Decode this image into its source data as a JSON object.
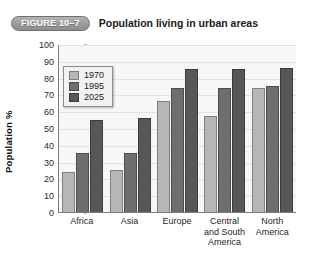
{
  "figure": {
    "badge_label": "FIGURE 10–7",
    "title": "Population living in urban areas"
  },
  "colors": {
    "series_1970": "#b6b6b6",
    "series_1995": "#6e6e6e",
    "series_2025": "#575757",
    "plot_background": "#f7f7f7",
    "gridline": "#e2e2e2",
    "axis": "#7d7d7d",
    "badge_background": "#9a9a9a",
    "badge_text": "#ffffff"
  },
  "chart_data": {
    "type": "bar",
    "title": "Population living in urban areas",
    "xlabel": "",
    "ylabel": "Population %",
    "ylim": [
      0,
      100
    ],
    "yticks": [
      0,
      10,
      20,
      30,
      40,
      50,
      60,
      70,
      80,
      90,
      100
    ],
    "grid": true,
    "legend_position": "top-left",
    "categories": [
      "Africa",
      "Asia",
      "Europe",
      "Central and South America",
      "North America"
    ],
    "series": [
      {
        "name": "1970",
        "values": [
          24,
          25,
          66,
          57,
          74
        ]
      },
      {
        "name": "1995",
        "values": [
          35,
          35,
          74,
          74,
          75
        ]
      },
      {
        "name": "2025",
        "values": [
          55,
          56,
          85,
          85,
          86
        ]
      }
    ]
  },
  "legend": {
    "items": [
      {
        "label": "1970"
      },
      {
        "label": "1995"
      },
      {
        "label": "2025"
      }
    ]
  }
}
